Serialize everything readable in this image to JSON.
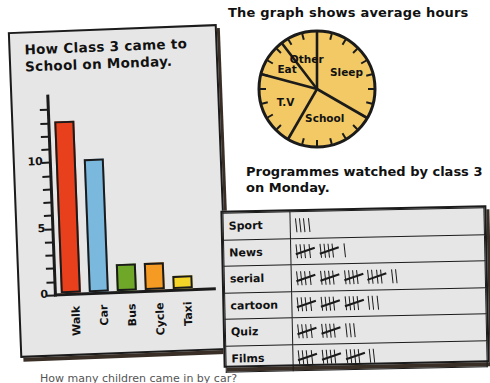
{
  "bar_chart": {
    "title": "How Class 3 came to School on Monday.",
    "y_labels": [
      "0",
      "5",
      "10"
    ]
  },
  "pie_chart": {
    "title": "The graph shows average hours"
  },
  "tally": {
    "title": "Programmes watched by class 3 on Monday."
  },
  "bottom_caption": "How many children came in by car?",
  "colors": {
    "walk": "#E8401C",
    "car": "#7AB8DE",
    "bus": "#6FA828",
    "cycle": "#F59A22",
    "taxi": "#F5D628",
    "pie_fill": "#F2C964",
    "ink": "#1B1B1B",
    "paper": "#E6E6E6"
  },
  "chart_data": [
    {
      "type": "bar",
      "title": "How Class 3 came to School on Monday.",
      "xlabel": "",
      "ylabel": "",
      "categories": [
        "Walk",
        "Car",
        "Bus",
        "Cycle",
        "Taxi"
      ],
      "values": [
        13,
        10,
        2,
        2,
        1
      ],
      "colors": [
        "#E8401C",
        "#7AB8DE",
        "#6FA828",
        "#F59A22",
        "#F5D628"
      ],
      "ylim": [
        0,
        15
      ],
      "yticks": [
        0,
        5,
        10
      ],
      "ytick_labels": [
        "0",
        "5",
        "10"
      ],
      "grid": false,
      "legend": "none"
    },
    {
      "type": "pie",
      "title": "The graph shows average hours",
      "labels": [
        "Sleep",
        "School",
        "T.V",
        "Eat",
        "Other"
      ],
      "values": [
        8,
        6,
        5,
        2.5,
        2.5
      ],
      "unit": "hours",
      "total": 24,
      "fill_color": "#F2C964",
      "note": "clock-face dial with 24 tick marks around the rim",
      "legend": "none"
    },
    {
      "type": "table",
      "title": "Programmes watched by class 3 on Monday.",
      "columns": [
        "Programme",
        "Tally"
      ],
      "rows": [
        {
          "label": "Sport",
          "tally": "||||",
          "count": 4
        },
        {
          "label": "News",
          "tally": "HHT HHT |",
          "count": 11
        },
        {
          "label": "serial",
          "tally": "HHT HHT HHT HHT ||",
          "count": 22
        },
        {
          "label": "cartoon",
          "tally": "HHT HHT HHT |||",
          "count": 18
        },
        {
          "label": "Quiz",
          "tally": "HHT HHT |||",
          "count": 13
        },
        {
          "label": "Films",
          "tally": "HHT HHT HHT ||",
          "count": 17
        }
      ]
    }
  ]
}
